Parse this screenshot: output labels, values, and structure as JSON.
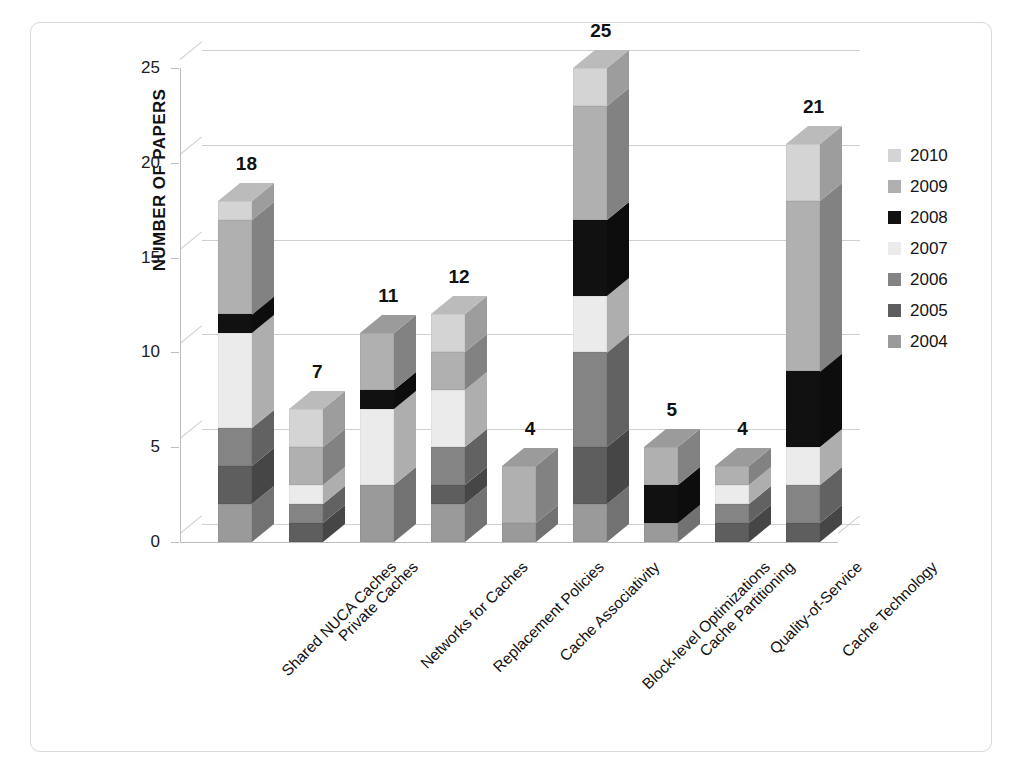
{
  "chart_data": {
    "type": "bar",
    "subtype": "stacked-3d-column",
    "title": "",
    "xlabel": "",
    "ylabel": "NUMBER OF PAPERS",
    "ylim": [
      0,
      25
    ],
    "yticks": [
      0,
      5,
      10,
      15,
      20,
      25
    ],
    "grid": true,
    "legend_position": "right",
    "categories": [
      "Shared NUCA Caches",
      "Private Caches",
      "Networks for Caches",
      "Replacement Policies",
      "Cache Associativity",
      "Block-level Optimizations",
      "Cache Partitioning",
      "Quality-of-Service",
      "Cache Technology"
    ],
    "totals": [
      18,
      7,
      11,
      12,
      4,
      25,
      5,
      4,
      21
    ],
    "series": [
      {
        "name": "2004",
        "color": "#9a9a9a",
        "values": [
          2,
          0,
          3,
          2,
          1,
          2,
          1,
          0,
          0
        ]
      },
      {
        "name": "2005",
        "color": "#5e5e5e",
        "values": [
          2,
          1,
          0,
          1,
          0,
          3,
          0,
          1,
          1
        ]
      },
      {
        "name": "2006",
        "color": "#848484",
        "values": [
          2,
          1,
          0,
          2,
          0,
          5,
          0,
          1,
          2
        ]
      },
      {
        "name": "2007",
        "color": "#ebebeb",
        "values": [
          5,
          1,
          4,
          3,
          0,
          3,
          0,
          1,
          2
        ]
      },
      {
        "name": "2008",
        "color": "#111111",
        "values": [
          1,
          0,
          1,
          0,
          0,
          4,
          2,
          0,
          4
        ]
      },
      {
        "name": "2009",
        "color": "#b0b0b0",
        "values": [
          5,
          2,
          3,
          2,
          3,
          6,
          2,
          1,
          9
        ]
      },
      {
        "name": "2010",
        "color": "#d4d4d4",
        "values": [
          1,
          2,
          0,
          2,
          0,
          2,
          0,
          0,
          3
        ]
      }
    ]
  },
  "legend": {
    "entries": [
      "2010",
      "2009",
      "2008",
      "2007",
      "2006",
      "2005",
      "2004"
    ]
  }
}
